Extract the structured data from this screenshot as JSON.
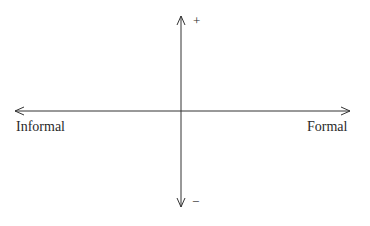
{
  "diagram": {
    "type": "quadrant-axes",
    "horizontal_axis": {
      "left_label": "Informal",
      "right_label": "Formal"
    },
    "vertical_axis": {
      "top_label": "+",
      "bottom_label": "−"
    },
    "colors": {
      "line": "#333333",
      "background": "#ffffff"
    }
  }
}
